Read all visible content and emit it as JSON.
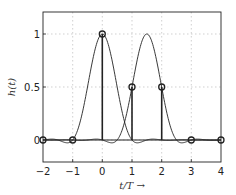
{
  "chart_data": {
    "type": "line",
    "title": "",
    "xlabel": "t/T →",
    "ylabel": "h(t)",
    "xlim": [
      -2,
      4
    ],
    "ylim": [
      -0.2,
      1.2
    ],
    "grid": true,
    "x_ticks": [
      "-2",
      "-1",
      "0",
      "1",
      "2",
      "3",
      "4"
    ],
    "y_ticks": [
      "0",
      "0.5",
      "1"
    ],
    "series": [
      {
        "name": "pulse centered at 0",
        "style": "smooth line",
        "peak_x": 0,
        "peak_y": 1
      },
      {
        "name": "pulse centered at 1.5",
        "style": "smooth line",
        "peak_x": 1.5,
        "peak_y": 1
      },
      {
        "name": "samples",
        "style": "stem with circle markers",
        "x": [
          -2,
          -1,
          0,
          1,
          2,
          3,
          4
        ],
        "y": [
          0,
          0,
          1,
          0.5,
          0.5,
          0,
          0
        ]
      }
    ]
  },
  "labels": {
    "xlabel": "t/T →",
    "ylabel": "h(t)",
    "xticks": [
      "−2",
      "−1",
      "0",
      "1",
      "2",
      "3",
      "4"
    ],
    "yticks": [
      "0",
      "0.5",
      "1"
    ]
  }
}
